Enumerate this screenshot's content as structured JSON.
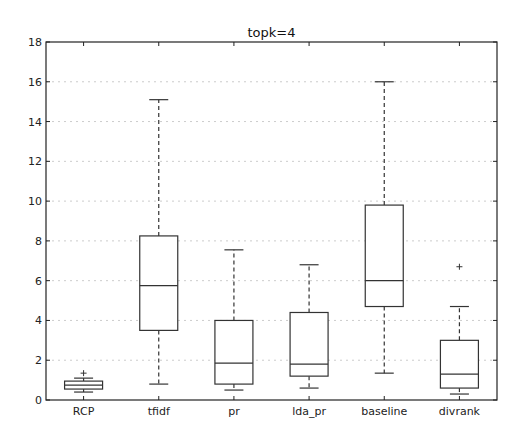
{
  "chart_data": {
    "type": "boxplot",
    "title": "topk=4",
    "xlabel": "",
    "ylabel": "",
    "ylim": [
      0,
      18
    ],
    "yticks": [
      0,
      2,
      4,
      6,
      8,
      10,
      12,
      14,
      16,
      18
    ],
    "grid": true,
    "categories": [
      "RCP",
      "tfidf",
      "pr",
      "lda_pr",
      "baseline",
      "divrank"
    ],
    "boxes": [
      {
        "name": "RCP",
        "whisker_low": 0.4,
        "q1": 0.55,
        "median": 0.75,
        "q3": 0.95,
        "whisker_high": 1.1,
        "outliers": [
          1.35
        ]
      },
      {
        "name": "tfidf",
        "whisker_low": 0.8,
        "q1": 3.5,
        "median": 5.75,
        "q3": 8.25,
        "whisker_high": 15.1,
        "outliers": []
      },
      {
        "name": "pr",
        "whisker_low": 0.5,
        "q1": 0.8,
        "median": 1.85,
        "q3": 4.0,
        "whisker_high": 7.55,
        "outliers": []
      },
      {
        "name": "lda_pr",
        "whisker_low": 0.6,
        "q1": 1.2,
        "median": 1.8,
        "q3": 4.4,
        "whisker_high": 6.8,
        "outliers": []
      },
      {
        "name": "baseline",
        "whisker_low": 1.35,
        "q1": 4.7,
        "median": 6.0,
        "q3": 9.8,
        "whisker_high": 16.0,
        "outliers": []
      },
      {
        "name": "divrank",
        "whisker_low": 0.3,
        "q1": 0.6,
        "median": 1.3,
        "q3": 3.0,
        "whisker_high": 4.7,
        "outliers": [
          6.7
        ]
      }
    ],
    "colors": {
      "box": "#333333",
      "grid": "#cccccc",
      "axis": "#222222"
    }
  }
}
